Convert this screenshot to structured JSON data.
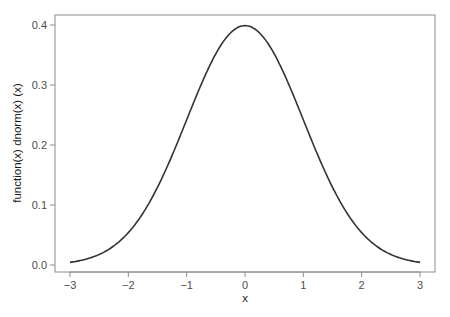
{
  "chart_data": {
    "type": "line",
    "title": "",
    "xlabel": "x",
    "ylabel": "function(x) dnorm(x) (x)",
    "xlim": [
      -3,
      3
    ],
    "ylim": [
      0,
      0.4
    ],
    "x_ticks": [
      -3,
      -2,
      -1,
      0,
      1,
      2,
      3
    ],
    "x_tick_labels": [
      "−3",
      "−2",
      "−1",
      "0",
      "1",
      "2",
      "3"
    ],
    "y_ticks": [
      0.0,
      0.1,
      0.2,
      0.3,
      0.4
    ],
    "y_tick_labels": [
      "0.0",
      "0.1",
      "0.2",
      "0.3",
      "0.4"
    ],
    "grid": false,
    "legend": null,
    "series": [
      {
        "name": "dnorm(x)",
        "color": "#333333",
        "x": [
          -3.0,
          -2.5,
          -2.0,
          -1.5,
          -1.0,
          -0.5,
          0.0,
          0.5,
          1.0,
          1.5,
          2.0,
          2.5,
          3.0
        ],
        "values": [
          0.0044,
          0.0175,
          0.054,
          0.1295,
          0.242,
          0.3521,
          0.3989,
          0.3521,
          0.242,
          0.1295,
          0.054,
          0.0175,
          0.0044
        ]
      }
    ]
  },
  "style": {
    "axis_color": "#8c8c8c",
    "curve_color": "#333333",
    "background": "#ffffff"
  }
}
